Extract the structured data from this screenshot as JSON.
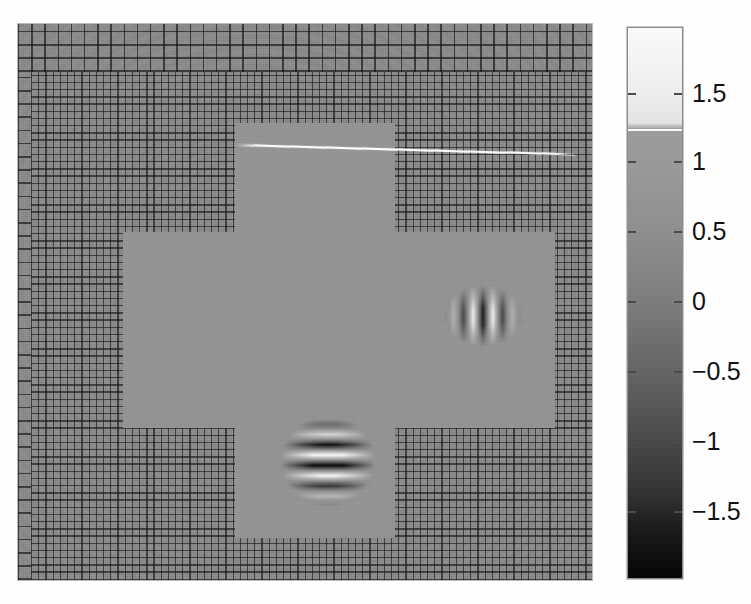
{
  "figure": {
    "type": "pseudocolor-amr-plot",
    "width": 751,
    "height": 604,
    "background_color": "#fdfdfd"
  },
  "chart_data": {
    "type": "heatmap",
    "title": "",
    "xlabel": "",
    "ylabel": "",
    "colormap": "gray",
    "grid": true,
    "legend_position": "right",
    "colorbar": {
      "orientation": "vertical",
      "min": -1.85,
      "max": 1.95,
      "tick_labels": [
        "1.5",
        "1",
        "0.5",
        "0",
        "-0.5",
        "-1",
        "-1.5"
      ],
      "tick_values": [
        1.5,
        1,
        0.5,
        0,
        -0.5,
        -1,
        -1.5
      ],
      "tick_y": [
        93,
        161,
        231,
        301,
        371,
        441,
        511
      ],
      "discontinuity_value": 1,
      "discontinuity_y": 129,
      "low_color": "#000000",
      "high_color": "#ffffff",
      "mid_color": "#7c7c7c"
    },
    "field": {
      "background_value": 0,
      "description": "adaptive-mesh-refinement wave field with two Gabor wave packets and a thin high-amplitude shock line"
    },
    "mesh_blocks": [
      {
        "name": "coarse-top-band",
        "level": 1,
        "x": 0,
        "y": 0,
        "w": 574,
        "h": 48,
        "cell_px": 13.2
      },
      {
        "name": "coarse-left-strip",
        "level": 1,
        "x": 0,
        "y": 48,
        "w": 13,
        "h": 508,
        "cell_px": 13.2
      },
      {
        "name": "fine-outer-region",
        "level": 2,
        "x": 13,
        "y": 48,
        "w": 561,
        "h": 508,
        "cell_px": 7.2
      }
    ],
    "refined_cross": {
      "description": "smooth fully-refined cross-shaped sub-domain (no mesh lines drawn)",
      "horizontal_arm": {
        "x": 105,
        "y": 208,
        "w": 432,
        "h": 196
      },
      "vertical_stem": {
        "x": 217,
        "y": 99,
        "w": 160,
        "h": 415
      }
    },
    "features": [
      {
        "name": "shock-line",
        "kind": "linear-discontinuity",
        "peak_value": 1.0,
        "x1": 222,
        "y1": 120,
        "x2": 560,
        "y2": 130
      },
      {
        "name": "wave-packet-right",
        "kind": "gabor-packet",
        "orientation": "vertical-stripes",
        "wave_vector": "horizontal",
        "amplitude": 1.0,
        "wavelength_px": 20,
        "center_x": 465,
        "center_y": 292,
        "width": 80,
        "height": 62
      },
      {
        "name": "wave-packet-bottom",
        "kind": "gabor-packet",
        "orientation": "horizontal-stripes",
        "wave_vector": "vertical",
        "amplitude": 1.85,
        "wavelength_px": 20.8,
        "center_x": 310,
        "center_y": 437,
        "width": 92,
        "height": 92
      }
    ],
    "axes_box": {
      "x": 18,
      "y": 24,
      "w": 574,
      "h": 556
    }
  }
}
